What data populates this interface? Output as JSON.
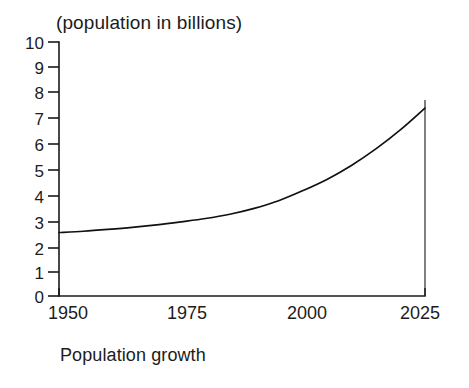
{
  "figure": {
    "title": "(population in billions)",
    "caption": "Population growth",
    "line_color": "#111111",
    "axis_color": "#1a1a1a",
    "background_color": "#ffffff"
  },
  "chart_data": {
    "type": "line",
    "title": "(population in billions)",
    "subtitle": "Population growth",
    "xlabel": "",
    "ylabel": "(population in billions)",
    "xlim": [
      1950,
      2025
    ],
    "ylim": [
      0,
      10
    ],
    "grid": false,
    "legend": "none",
    "xticks": [
      1950,
      1975,
      2000,
      2025
    ],
    "xtick_labels": [
      "1950",
      "1975",
      "2000",
      "2025"
    ],
    "yticks": [
      0,
      1,
      2,
      3,
      4,
      5,
      6,
      7,
      8,
      9,
      10
    ],
    "ytick_labels": [
      "0",
      "1",
      "2",
      "3",
      "4",
      "5",
      "6",
      "7",
      "8",
      "9",
      "10"
    ],
    "series": [
      {
        "name": "World population",
        "x": [
          1950,
          1955,
          1960,
          1965,
          1970,
          1975,
          1980,
          1985,
          1990,
          1995,
          2000,
          2005,
          2010,
          2015,
          2020,
          2025
        ],
        "values": [
          2.5,
          2.55,
          2.62,
          2.7,
          2.8,
          2.92,
          3.05,
          3.22,
          3.45,
          3.75,
          4.15,
          4.6,
          5.15,
          5.8,
          6.55,
          7.4
        ]
      }
    ],
    "annotations": [
      {
        "text": "vertical rule at 2025",
        "x": 2025
      }
    ]
  }
}
